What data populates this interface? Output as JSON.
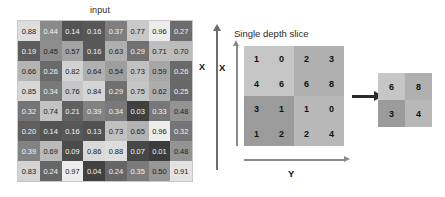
{
  "input_panel": {
    "title": "input",
    "axis_label_x": "X",
    "grid": {
      "rows": 8,
      "cols": 8,
      "values": [
        [
          "0.88",
          "0.44",
          "0.14",
          "0.16",
          "0.37",
          "0.77",
          "0.96",
          "0.27"
        ],
        [
          "0.19",
          "0.45",
          "0.57",
          "0.16",
          "0.63",
          "0.29",
          "0.71",
          "0.70"
        ],
        [
          "0.66",
          "0.26",
          "0.82",
          "0.64",
          "0.54",
          "0.73",
          "0.59",
          "0.26"
        ],
        [
          "0.85",
          "0.34",
          "0.76",
          "0.84",
          "0.29",
          "0.75",
          "0.62",
          "0.25"
        ],
        [
          "0.32",
          "0.74",
          "0.21",
          "0.39",
          "0.34",
          "0.03",
          "0.33",
          "0.48"
        ],
        [
          "0.20",
          "0.14",
          "0.16",
          "0.13",
          "0.73",
          "0.65",
          "0.96",
          "0.32"
        ],
        [
          "0.39",
          "0.69",
          "0.09",
          "0.86",
          "0.88",
          "0.07",
          "0.01",
          "0.48"
        ],
        [
          "0.83",
          "0.24",
          "0.97",
          "0.04",
          "0.24",
          "0.35",
          "0.50",
          "0.91"
        ]
      ]
    }
  },
  "slice_panel": {
    "title": "Single depth slice",
    "axis_label_x": "X",
    "axis_label_y": "Y",
    "grid": {
      "rows": 4,
      "cols": 4,
      "values": [
        [
          "1",
          "0",
          "2",
          "3"
        ],
        [
          "4",
          "6",
          "6",
          "8"
        ],
        [
          "3",
          "1",
          "1",
          "0"
        ],
        [
          "1",
          "2",
          "2",
          "4"
        ]
      ],
      "quadrant_colors": {
        "top_left": "#c6c6c6",
        "top_right": "#b0b0b0",
        "bottom_left": "#9b9b9b",
        "bottom_right": "#b8b8b8"
      }
    }
  },
  "arrow": {
    "name": "max-pool-arrow",
    "color": "#2a2a2a"
  },
  "output_panel": {
    "grid": {
      "rows": 2,
      "cols": 2,
      "values": [
        [
          "6",
          "8"
        ],
        [
          "3",
          "4"
        ]
      ],
      "cell_colors": [
        [
          "#c6c6c6",
          "#b0b0b0"
        ],
        [
          "#9b9b9b",
          "#b8b8b8"
        ]
      ]
    }
  },
  "chart_data": {
    "type": "heatmap",
    "title": "input",
    "xlabel": "",
    "ylabel": "X",
    "categories": [
      "c1",
      "c2",
      "c3",
      "c4",
      "c5",
      "c6",
      "c7",
      "c8"
    ],
    "values": [
      [
        0.88,
        0.44,
        0.14,
        0.16,
        0.37,
        0.77,
        0.96,
        0.27
      ],
      [
        0.19,
        0.45,
        0.57,
        0.16,
        0.63,
        0.29,
        0.71,
        0.7
      ],
      [
        0.66,
        0.26,
        0.82,
        0.64,
        0.54,
        0.73,
        0.59,
        0.26
      ],
      [
        0.85,
        0.34,
        0.76,
        0.84,
        0.29,
        0.75,
        0.62,
        0.25
      ],
      [
        0.32,
        0.74,
        0.21,
        0.39,
        0.34,
        0.03,
        0.33,
        0.48
      ],
      [
        0.2,
        0.14,
        0.16,
        0.13,
        0.73,
        0.65,
        0.96,
        0.32
      ],
      [
        0.39,
        0.69,
        0.09,
        0.86,
        0.88,
        0.07,
        0.01,
        0.48
      ],
      [
        0.83,
        0.24,
        0.97,
        0.04,
        0.24,
        0.35,
        0.5,
        0.91
      ]
    ],
    "zlim": [
      0.0,
      1.0
    ],
    "colormap": "grayscale",
    "grid": false,
    "legend": "none"
  }
}
